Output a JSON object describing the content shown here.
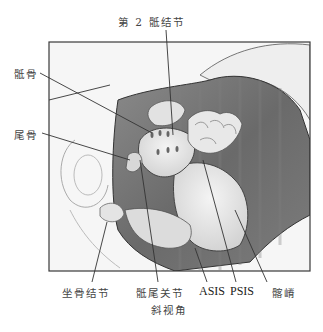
{
  "figure": {
    "caption": "斜视角",
    "labels": {
      "sacral_2": "第 2 骶结节",
      "sacrum": "骶骨",
      "coccyx": "尾骨",
      "ischial_tuberosity": "坐骨结节",
      "sacrococcygeal_joint": "骶尾关节",
      "asis": "ASIS",
      "psis": "PSIS",
      "iliac_crest": "髂嵴"
    },
    "colors": {
      "frame": "#3a3a3a",
      "body_dark": "#6e6e6e",
      "body_mid": "#9a9a9a",
      "bone": "#e6e6e6",
      "skin": "#f2f2f2",
      "leader": "#333333"
    }
  }
}
